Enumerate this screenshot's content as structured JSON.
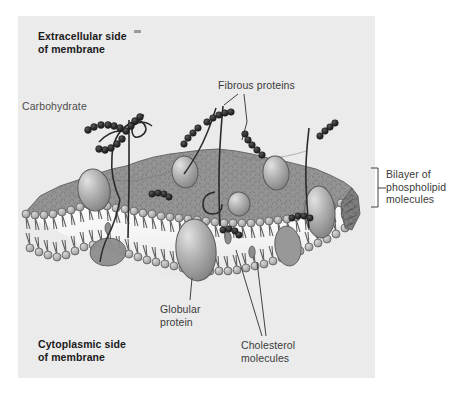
{
  "figure": {
    "width": 467,
    "height": 393,
    "background_color": "#ffffff",
    "panel_color": "#ebebeb"
  },
  "labels": {
    "extracellular": "Extracellular side\nof membrane",
    "carbohydrate": "Carbohydrate",
    "fibrous_proteins": "Fibrous proteins",
    "bilayer": "Bilayer of\nphospholipid\nmolecules",
    "globular_protein": "Globular\nprotein",
    "cholesterol": "Cholesterol\nmolecules",
    "cytoplasmic": "Cytoplasmic side\nof membrane"
  },
  "colors": {
    "membrane_surface": "#949494",
    "membrane_surface_dark": "#6f6f6f",
    "lipid_head": "#b4b4b4",
    "lipid_head_edge": "#5a5a5a",
    "lipid_tail": "#5e5e5e",
    "protein_fill": "#a8a8a8",
    "protein_highlight": "#d2d2d2",
    "protein_edge": "#555555",
    "carbohydrate": "#2b2b2b",
    "fibrous_protein": "#262626",
    "cholesterol": "#8a8a8a",
    "leader_line": "#333333",
    "label_text": "#4d4d4d",
    "label_text_bold": "#1a1a1a"
  },
  "structures": [
    {
      "name": "phospholipid-bilayer",
      "description": "Two opposed leaflets of phospholipid molecules; spherical hydrophilic heads face outward, hydrophobic tails face inward"
    },
    {
      "name": "globular-proteins",
      "description": "Ovoid integral proteins embedded in and spanning the bilayer"
    },
    {
      "name": "fibrous-proteins",
      "description": "Thin thread-like proteins threading through the membrane"
    },
    {
      "name": "carbohydrate-chains",
      "description": "Branched beaded sugar chains projecting from the extracellular surface"
    },
    {
      "name": "cholesterol-molecules",
      "description": "Small molecules wedged between phospholipid tails within the bilayer"
    }
  ]
}
